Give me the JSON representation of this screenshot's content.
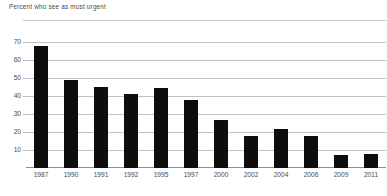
{
  "chart_data": {
    "type": "bar",
    "title": "Percent who see as most urgent",
    "xlabel": "",
    "ylabel": "",
    "categories": [
      "1987",
      "1990",
      "1991",
      "1992",
      "1995",
      "1997",
      "2000",
      "2002",
      "2004",
      "2006",
      "2009",
      "2011"
    ],
    "values": [
      68,
      49,
      45,
      41.5,
      44.5,
      38,
      27,
      18,
      22,
      18,
      7,
      8
    ],
    "ylim": [
      0,
      73
    ],
    "yticks": [
      10,
      20,
      30,
      40,
      50,
      60,
      70
    ],
    "ytick_labels": [
      "10",
      "20",
      "30",
      "40",
      "50",
      "60",
      "70"
    ],
    "grid": true,
    "legend": false,
    "bar_color": "#0d0d0d",
    "gridline_color": "#c2c2c2",
    "axis_color": "#8e8e8e",
    "background_color": "#ffffff",
    "text_color": "#4a4a4a"
  }
}
